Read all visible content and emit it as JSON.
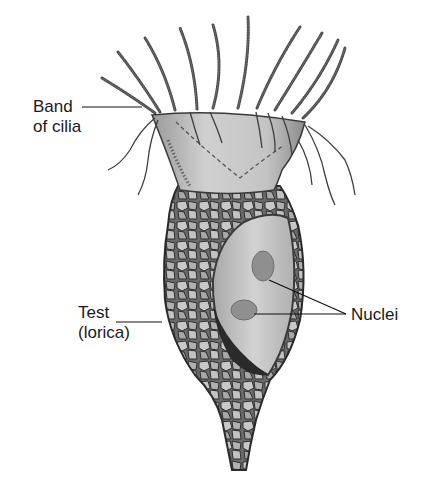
{
  "diagram": {
    "labels": {
      "band_of_cilia": {
        "line1": "Band",
        "line2": "of cilia"
      },
      "test": {
        "line1": "Test",
        "line2": "(lorica)"
      },
      "nuclei": {
        "line1": "Nuclei"
      }
    },
    "colors": {
      "background": "#ffffff",
      "text": "#1a1a1a",
      "cone": "#c9c9c9",
      "lorica_plate": "#b5b5b5",
      "lorica_outline": "#3a3a3a",
      "cell_body": "#bdbdbd",
      "nucleus": "#8f8f8f",
      "shadow": "#2a2a2a"
    }
  }
}
